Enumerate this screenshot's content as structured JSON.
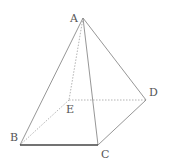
{
  "diagram": {
    "type": "pyramid",
    "vertices": {
      "A": {
        "label": "A",
        "x": 83,
        "y": 18,
        "lx": 70,
        "ly": 22
      },
      "B": {
        "label": "B",
        "x": 20,
        "y": 145,
        "lx": 10,
        "ly": 141
      },
      "C": {
        "label": "C",
        "x": 98,
        "y": 145,
        "lx": 101,
        "ly": 158
      },
      "D": {
        "label": "D",
        "x": 146,
        "y": 100,
        "lx": 149,
        "ly": 96
      },
      "E": {
        "label": "E",
        "x": 69,
        "y": 100,
        "lx": 66,
        "ly": 113
      }
    },
    "solid_edges": [
      [
        "A",
        "B"
      ],
      [
        "A",
        "C"
      ],
      [
        "A",
        "D"
      ],
      [
        "B",
        "C"
      ],
      [
        "C",
        "D"
      ]
    ],
    "hidden_edges": [
      [
        "A",
        "E"
      ],
      [
        "E",
        "B"
      ],
      [
        "E",
        "D"
      ]
    ],
    "colors": {
      "line": "#8a8a8a",
      "base_front": "#444444",
      "hidden": "#aaaaaa",
      "label": "#555555"
    }
  }
}
